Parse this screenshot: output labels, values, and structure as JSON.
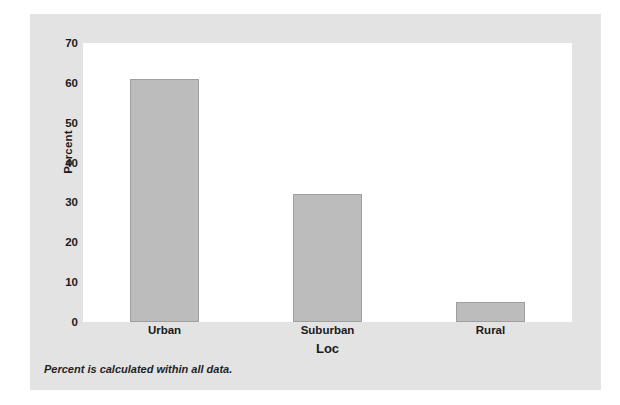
{
  "chart_data": {
    "type": "bar",
    "title": "",
    "categories": [
      "Urban",
      "Suburban",
      "Rural"
    ],
    "values": [
      61,
      32,
      5
    ],
    "xlabel": "Loc",
    "ylabel": "Percent",
    "ylim": [
      0,
      70
    ],
    "yticks": [
      0,
      10,
      20,
      30,
      40,
      50,
      60,
      70
    ],
    "ytick_labels": [
      "0",
      "10",
      "20",
      "30",
      "40",
      "50",
      "60",
      "70"
    ],
    "grid": false,
    "legend": null,
    "footnote": "Percent is calculated within all data.",
    "colors": {
      "bar_fill": "#bcbcbc",
      "bar_edge": "#9f9f9f",
      "panel_background": "#e3e3e3",
      "plot_background": "#ffffff",
      "text": "#1a1a1a"
    }
  }
}
